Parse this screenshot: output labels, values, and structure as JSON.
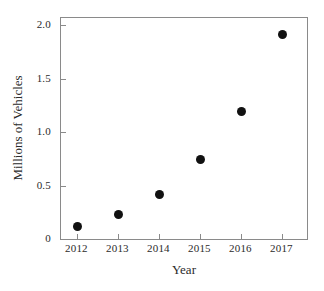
{
  "chart_data": {
    "type": "scatter",
    "title": "",
    "xlabel": "Year",
    "ylabel": "Millions of Vehicles",
    "categories": [
      "2012",
      "2013",
      "2014",
      "2015",
      "2016",
      "2017"
    ],
    "x": [
      2012,
      2013,
      2014,
      2015,
      2016,
      2017
    ],
    "values": [
      0.12,
      0.23,
      0.42,
      0.74,
      1.19,
      1.92
    ],
    "series": [
      {
        "name": "Vehicles",
        "values": [
          0.12,
          0.23,
          0.42,
          0.74,
          1.19,
          1.92
        ]
      }
    ],
    "xlim": [
      2011.6,
      2017.6
    ],
    "ylim": [
      0,
      2.07
    ],
    "xticks": [
      2012,
      2013,
      2014,
      2015,
      2016,
      2017
    ],
    "xtick_labels": [
      "2012",
      "2013",
      "2014",
      "2015",
      "2016",
      "2017"
    ],
    "yticks": [
      0,
      0.5,
      1.0,
      1.5,
      2.0
    ],
    "ytick_labels": [
      "0",
      "0.5",
      "1.0",
      "1.5",
      "2.0"
    ],
    "grid": false,
    "legend": false,
    "legend_position": "none",
    "marker_color": "#111111",
    "marker_shape": "circle",
    "frame_color": "#8a8a8a",
    "background_color": "#ffffff",
    "annotations": []
  }
}
